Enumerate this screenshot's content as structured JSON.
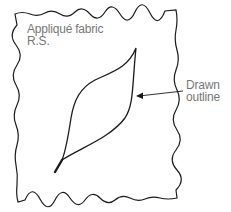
{
  "diagram": {
    "fabric_label": {
      "line1": "Appliqué fabric",
      "line2": "R.S."
    },
    "callout_label": {
      "line1": "Drawn",
      "line2": "outline"
    },
    "colors": {
      "line": "#1a1a1a",
      "text": "#777777",
      "background": "#ffffff"
    },
    "elements": [
      {
        "id": "fabric-piece",
        "shape": "wavy-rectangle"
      },
      {
        "id": "leaf-outline",
        "shape": "leaf"
      },
      {
        "id": "callout-arrow",
        "shape": "arrow",
        "points_to": "leaf-outline"
      }
    ]
  }
}
